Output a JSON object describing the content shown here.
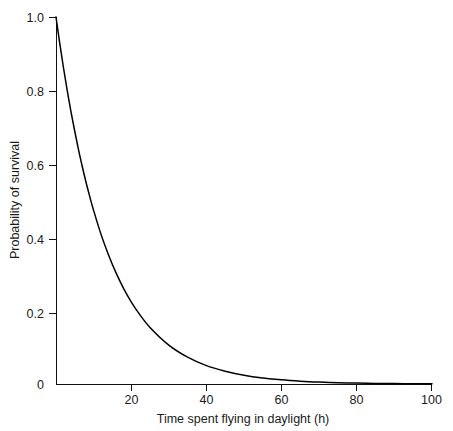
{
  "chart_data": {
    "type": "line",
    "title": "",
    "xlabel": "Time spent flying in daylight (h)",
    "ylabel": "Probability of survival",
    "xlim": [
      0,
      100
    ],
    "ylim": [
      0,
      1.0
    ],
    "grid": false,
    "legend": null,
    "xticks": [
      "20",
      "40",
      "60",
      "80",
      "100"
    ],
    "xtick_values": [
      20,
      40,
      60,
      80,
      100
    ],
    "yticks": [
      "0",
      "0.2",
      "0.4",
      "0.6",
      "0.8",
      "1.0"
    ],
    "ytick_values": [
      0,
      0.2,
      0.4,
      0.6,
      0.8,
      1.0
    ],
    "series": [
      {
        "name": "Probability of survival",
        "color": "#000000",
        "x": [
          0,
          1,
          2,
          3,
          4,
          5,
          6,
          7,
          8,
          9,
          10,
          12,
          14,
          16,
          18,
          20,
          22,
          25,
          30,
          35,
          40,
          45,
          50,
          55,
          60,
          65,
          70,
          75,
          80,
          85,
          90,
          95,
          100
        ],
        "y": [
          1.0,
          0.928,
          0.861,
          0.799,
          0.741,
          0.688,
          0.638,
          0.592,
          0.549,
          0.51,
          0.473,
          0.407,
          0.351,
          0.302,
          0.26,
          0.224,
          0.193,
          0.154,
          0.106,
          0.073,
          0.05,
          0.035,
          0.024,
          0.0165,
          0.0113,
          0.0078,
          0.0054,
          0.0037,
          0.0025,
          0.0017,
          0.0012,
          0.0008,
          0.0006
        ]
      }
    ],
    "annotations": []
  },
  "figure": {
    "background_color": "#ffffff",
    "axis_color": "#111111",
    "text_color": "#1a1a1a"
  }
}
